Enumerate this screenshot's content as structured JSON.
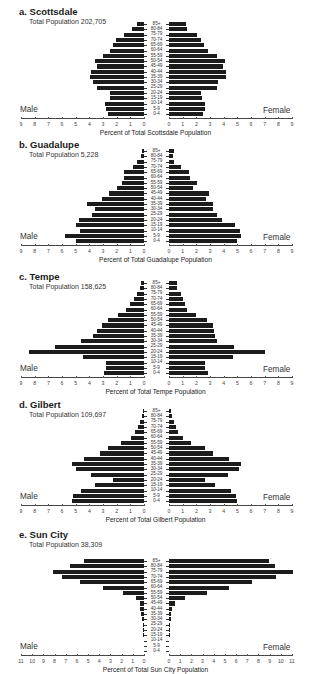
{
  "chart_data": [
    {
      "type": "bar",
      "orientation": "horizontal-population-pyramid",
      "title": "a. Scottsdale",
      "subtitle": "Total Population 202,705",
      "xlabel": "Percent of Total Scottsdale Population",
      "left_label": "Male",
      "right_label": "Female",
      "xlim": [
        0,
        9
      ],
      "ticks": [
        9,
        8,
        7,
        6,
        5,
        4,
        3,
        2,
        1,
        0
      ],
      "categories": [
        "85+",
        "80-84",
        "75-79",
        "70-74",
        "65-69",
        "60-64",
        "55-59",
        "50-54",
        "45-49",
        "40-44",
        "35-39",
        "30-34",
        "25-29",
        "20-24",
        "15-19",
        "10-14",
        "5-9",
        "0-4"
      ],
      "series": [
        {
          "name": "Male",
          "values": [
            0.5,
            0.85,
            1.5,
            2.05,
            2.25,
            2.5,
            3.0,
            3.55,
            3.45,
            3.9,
            3.95,
            3.7,
            3.45,
            2.5,
            2.5,
            2.85,
            2.8,
            2.65
          ]
        },
        {
          "name": "Female",
          "values": [
            1.25,
            1.3,
            2.05,
            2.35,
            2.55,
            2.85,
            3.5,
            4.1,
            3.95,
            4.15,
            4.15,
            3.6,
            3.5,
            2.35,
            2.4,
            2.65,
            2.65,
            2.5
          ]
        }
      ]
    },
    {
      "type": "bar",
      "orientation": "horizontal-population-pyramid",
      "title": "b. Guadalupe",
      "subtitle": "Total Population 5,228",
      "xlabel": "Percent of Total Guadalupe Population",
      "left_label": "Male",
      "right_label": "Female",
      "xlim": [
        0,
        9
      ],
      "ticks": [
        9,
        8,
        7,
        6,
        5,
        4,
        3,
        2,
        1,
        0
      ],
      "categories": [
        "85+",
        "80-84",
        "75-79",
        "70-74",
        "65-69",
        "60-64",
        "55-59",
        "50-54",
        "45-49",
        "40-44",
        "35-39",
        "30-34",
        "25-29",
        "20-24",
        "15-19",
        "10-14",
        "5-9",
        "0-4"
      ],
      "series": [
        {
          "name": "Male",
          "values": [
            0.15,
            0.25,
            0.5,
            0.8,
            1.45,
            1.5,
            1.6,
            2.0,
            2.55,
            3.1,
            4.2,
            3.6,
            3.8,
            4.75,
            5.0,
            4.7,
            5.8,
            5.0
          ]
        },
        {
          "name": "Female",
          "values": [
            0.35,
            0.3,
            0.4,
            0.85,
            1.45,
            1.55,
            2.05,
            1.75,
            2.9,
            2.7,
            3.2,
            3.2,
            3.5,
            3.9,
            4.8,
            5.2,
            5.25,
            5.0
          ]
        }
      ]
    },
    {
      "type": "bar",
      "orientation": "horizontal-population-pyramid",
      "title": "c. Tempe",
      "subtitle": "Total Population 158,625",
      "xlabel": "Percent of Total Tempe Population",
      "left_label": "Male",
      "right_label": "Female",
      "xlim": [
        0,
        9
      ],
      "ticks": [
        9,
        8,
        7,
        6,
        5,
        4,
        3,
        2,
        1,
        0
      ],
      "categories": [
        "85+",
        "80-84",
        "75-79",
        "70-74",
        "65-69",
        "60-64",
        "55-59",
        "50-54",
        "45-49",
        "40-44",
        "35-39",
        "30-34",
        "25-29",
        "20-24",
        "15-19",
        "10-14",
        "5-9",
        "0-4"
      ],
      "series": [
        {
          "name": "Male",
          "values": [
            0.25,
            0.3,
            0.5,
            0.75,
            1.0,
            1.35,
            1.9,
            2.65,
            3.05,
            3.45,
            3.7,
            4.6,
            6.5,
            8.4,
            4.5,
            2.8,
            2.8,
            2.9
          ]
        },
        {
          "name": "Female",
          "values": [
            0.6,
            0.6,
            0.9,
            1.0,
            1.15,
            1.35,
            2.0,
            2.8,
            3.2,
            3.3,
            3.35,
            3.5,
            4.75,
            7.0,
            4.7,
            2.65,
            2.6,
            2.85
          ]
        }
      ]
    },
    {
      "type": "bar",
      "orientation": "horizontal-population-pyramid",
      "title": "d. Gilbert",
      "subtitle": "Total Population 109,697",
      "xlabel": "Percent of Total Gilbert Population",
      "left_label": "Male",
      "right_label": "Female",
      "xlim": [
        0,
        9
      ],
      "ticks": [
        9,
        8,
        7,
        6,
        5,
        4,
        3,
        2,
        1,
        0
      ],
      "categories": [
        "85+",
        "80-84",
        "75-79",
        "70-74",
        "65-69",
        "60-64",
        "55-59",
        "50-54",
        "45-49",
        "40-44",
        "35-39",
        "30-34",
        "25-29",
        "20-24",
        "15-19",
        "10-14",
        "5-9",
        "0-4"
      ],
      "series": [
        {
          "name": "Male",
          "values": [
            0.1,
            0.15,
            0.3,
            0.45,
            0.65,
            0.95,
            1.7,
            2.6,
            3.2,
            4.4,
            5.3,
            5.0,
            3.9,
            2.3,
            3.6,
            4.6,
            5.2,
            5.3
          ]
        },
        {
          "name": "Female",
          "values": [
            0.15,
            0.2,
            0.4,
            0.5,
            0.65,
            1.0,
            1.6,
            2.6,
            3.2,
            4.4,
            5.3,
            5.1,
            4.3,
            2.6,
            3.4,
            4.5,
            4.9,
            5.0
          ]
        }
      ]
    },
    {
      "type": "bar",
      "orientation": "horizontal-population-pyramid",
      "title": "e. Sun City",
      "subtitle": "Total Population 38,309",
      "xlabel": "Percent of Total Sun City Population",
      "left_label": "Male",
      "right_label": "Female",
      "xlim": [
        0,
        11
      ],
      "ticks": [
        11,
        10,
        9,
        8,
        7,
        6,
        5,
        4,
        3,
        2,
        1,
        0
      ],
      "categories": [
        "85+",
        "80-84",
        "75-79",
        "70-74",
        "65-69",
        "60-64",
        "55-59",
        "50-54",
        "45-49",
        "40-44",
        "35-39",
        "30-34",
        "25-29",
        "20-24",
        "15-19",
        "10-14",
        "5-9",
        "0-4"
      ],
      "series": [
        {
          "name": "Male",
          "values": [
            5.4,
            6.6,
            8.1,
            7.3,
            5.7,
            3.7,
            1.9,
            0.7,
            0.4,
            0.4,
            0.3,
            0.2,
            0.1,
            0.1,
            0.1,
            0.0,
            0.0,
            0.0
          ]
        },
        {
          "name": "Female",
          "values": [
            8.9,
            9.5,
            11.1,
            9.6,
            7.4,
            5.4,
            3.4,
            1.4,
            0.5,
            0.3,
            0.2,
            0.2,
            0.1,
            0.1,
            0.05,
            0.0,
            0.0,
            0.0
          ]
        }
      ]
    }
  ],
  "layout": {
    "panel_tops": [
      0,
      133,
      265,
      393,
      525
    ],
    "row_top_offsets": [
      18,
      16,
      16,
      16,
      34
    ],
    "row_height": 5.3,
    "bar_height": 4.2,
    "left_zero_x": 144,
    "right_zero_x": 169,
    "axis_span_px": 123
  }
}
